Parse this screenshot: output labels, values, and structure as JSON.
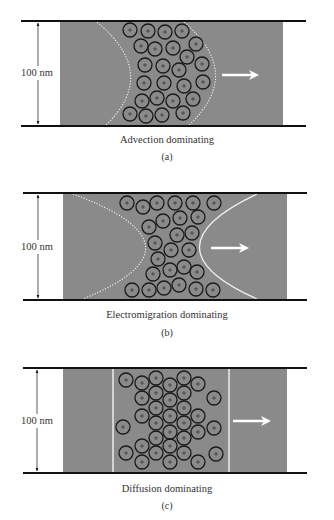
{
  "figure": {
    "colors": {
      "channel_fill": "#8a8a8a",
      "wall_line": "#111111",
      "particle_stroke": "#1a1a1a",
      "interface": "#f2f2f2",
      "arrow": "#ffffff",
      "text": "#333333"
    },
    "particle_radius": 7,
    "panels": [
      {
        "id": "a",
        "caption": "Advection dominating",
        "label": "(a)",
        "dimension_label": "100 nm",
        "wall_top_y": 21,
        "wall_bottom_y": 126,
        "wall_x": [
          21,
          306
        ],
        "fill_x": [
          60,
          283
        ],
        "dim_arrow_x": 38,
        "caption_y": 134,
        "label_y": 151,
        "flow_arrow": {
          "x1": 222,
          "x2": 256,
          "y": 75
        },
        "interfaces": [
          {
            "style": "dotted",
            "path": "M97,22 Q160,74 105,126"
          },
          {
            "style": "dotted",
            "path": "M184,22 Q245,74 188,126"
          }
        ],
        "particles": [
          [
            130,
            30
          ],
          [
            148,
            31
          ],
          [
            165,
            32
          ],
          [
            182,
            31
          ],
          [
            141,
            46
          ],
          [
            155,
            49
          ],
          [
            173,
            48
          ],
          [
            196,
            44
          ],
          [
            187,
            57
          ],
          [
            145,
            65
          ],
          [
            163,
            66
          ],
          [
            179,
            70
          ],
          [
            202,
            64
          ],
          [
            144,
            83
          ],
          [
            164,
            83
          ],
          [
            184,
            86
          ],
          [
            203,
            82
          ],
          [
            142,
            101
          ],
          [
            157,
            98
          ],
          [
            173,
            101
          ],
          [
            193,
            99
          ],
          [
            130,
            114
          ],
          [
            146,
            116
          ],
          [
            162,
            115
          ],
          [
            183,
            113
          ]
        ]
      },
      {
        "id": "b",
        "caption": "Electromigration dominating",
        "label": "(b)",
        "dimension_label": "100 nm",
        "wall_top_y": 193,
        "wall_bottom_y": 300,
        "wall_x": [
          23,
          307
        ],
        "fill_x": [
          63,
          287
        ],
        "dim_arrow_x": 38,
        "caption_y": 309,
        "label_y": 327,
        "flow_arrow": {
          "x1": 211,
          "x2": 246,
          "y": 248
        },
        "interfaces": [
          {
            "style": "dotted",
            "path": "M73,194 Q213,246 83,299"
          },
          {
            "style": "solid",
            "path": "M257,194 Q142,248 257,299"
          }
        ],
        "particles": [
          [
            127,
            203
          ],
          [
            143,
            207
          ],
          [
            157,
            203
          ],
          [
            175,
            203
          ],
          [
            193,
            203
          ],
          [
            214,
            203
          ],
          [
            163,
            221
          ],
          [
            180,
            218
          ],
          [
            198,
            217
          ],
          [
            149,
            227
          ],
          [
            177,
            235
          ],
          [
            192,
            233
          ],
          [
            155,
            243
          ],
          [
            171,
            250
          ],
          [
            189,
            250
          ],
          [
            158,
            259
          ],
          [
            170,
            270
          ],
          [
            184,
            267
          ],
          [
            197,
            272
          ],
          [
            153,
            274
          ],
          [
            132,
            290
          ],
          [
            149,
            290
          ],
          [
            164,
            288
          ],
          [
            179,
            285
          ],
          [
            196,
            289
          ],
          [
            213,
            290
          ]
        ]
      },
      {
        "id": "c",
        "caption": "Diffusion dominating",
        "label": "(c)",
        "dimension_label": "100 nm",
        "wall_top_y": 368,
        "wall_bottom_y": 473,
        "wall_x": [
          23,
          307
        ],
        "fill_x": [
          63,
          287
        ],
        "dim_arrow_x": 37,
        "caption_y": 483,
        "label_y": 500,
        "flow_arrow": {
          "x1": 233,
          "x2": 268,
          "y": 421
        },
        "interfaces": [
          {
            "style": "solid-thin",
            "path": "M113,369 L113,472"
          },
          {
            "style": "solid-thin",
            "path": "M229,369 L229,472"
          }
        ],
        "particles": [
          [
            126,
            380
          ],
          [
            142,
            383
          ],
          [
            156,
            378
          ],
          [
            170,
            385
          ],
          [
            184,
            378
          ],
          [
            198,
            384
          ],
          [
            142,
            398
          ],
          [
            156,
            393
          ],
          [
            170,
            400
          ],
          [
            184,
            393
          ],
          [
            214,
            398
          ],
          [
            156,
            408
          ],
          [
            184,
            408
          ],
          [
            142,
            416
          ],
          [
            170,
            416
          ],
          [
            198,
            416
          ],
          [
            123,
            427
          ],
          [
            156,
            423
          ],
          [
            184,
            423
          ],
          [
            170,
            432
          ],
          [
            198,
            432
          ],
          [
            214,
            428
          ],
          [
            156,
            438
          ],
          [
            184,
            438
          ],
          [
            142,
            446
          ],
          [
            170,
            446
          ],
          [
            126,
            453
          ],
          [
            156,
            453
          ],
          [
            184,
            453
          ],
          [
            216,
            454
          ],
          [
            142,
            462
          ],
          [
            170,
            462
          ],
          [
            198,
            462
          ]
        ]
      }
    ]
  }
}
